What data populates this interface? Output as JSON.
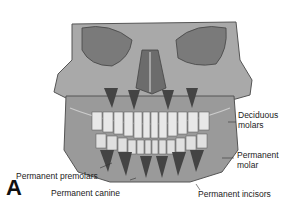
{
  "figure": {
    "panel_letter": "A",
    "labels": {
      "deciduous_molars_1": "Deciduous",
      "deciduous_molars_2": "molars",
      "permanent_molar_1": "Permanent",
      "permanent_molar_2": "molar",
      "permanent_premolars": "Permanent premolars",
      "permanent_canine": "Permanent canine",
      "permanent_incisors": "Permanent incisors"
    }
  }
}
